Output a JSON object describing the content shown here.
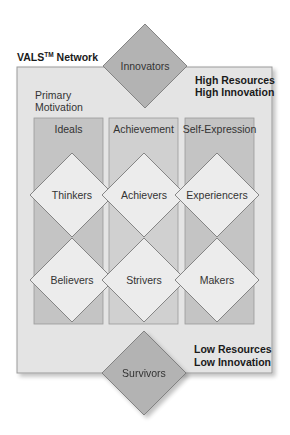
{
  "title": {
    "prefix": "VALS",
    "trademark": "TM",
    "suffix": " Network"
  },
  "axis_label": {
    "line1": "Primary",
    "line2": "Motivation"
  },
  "top_corner": {
    "line1": "High Resources",
    "line2": "High Innovation"
  },
  "bottom_corner": {
    "line1": "Low Resources",
    "line2": "Low Innovation"
  },
  "top_segment": {
    "label": "Innovators"
  },
  "bottom_segment": {
    "label": "Survivors"
  },
  "columns": [
    {
      "label": "Ideals"
    },
    {
      "label": "Achievement"
    },
    {
      "label": "Self-Expression"
    }
  ],
  "segments": {
    "high": [
      {
        "label": "Thinkers"
      },
      {
        "label": "Achievers"
      },
      {
        "label": "Experiencers"
      }
    ],
    "low": [
      {
        "label": "Believers"
      },
      {
        "label": "Strivers"
      },
      {
        "label": "Makers"
      }
    ]
  },
  "colors": {
    "box_bg": "#e4e4e4",
    "column_dark": "#c4c4c4",
    "column_light": "#d0d0d0",
    "diamond_light": "#ececec",
    "diamond_dark": "#b3b3b3",
    "stroke": "#8a8a8a"
  }
}
